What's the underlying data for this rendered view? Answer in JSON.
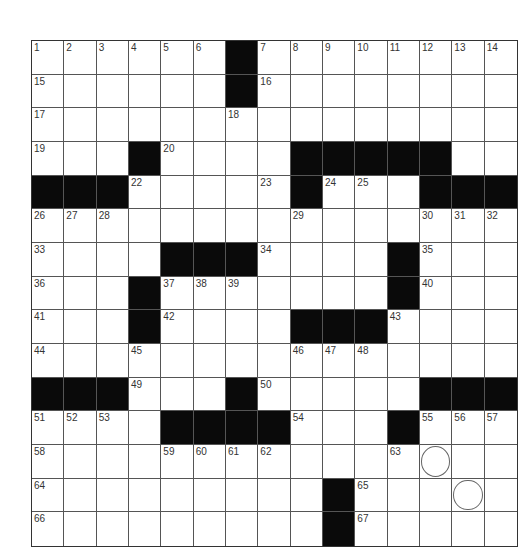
{
  "puzzle": {
    "rows": 15,
    "cols": 15,
    "layout": [
      "......#........",
      "......#........",
      "...............",
      "...#....#####..",
      "###.....#...###",
      "...............",
      "....###....#...",
      "...#.......#...",
      "...#....###....",
      "...............",
      "###...#.....###",
      "....####...#...",
      "...............",
      ".........#.....",
      ".........#....."
    ],
    "numbers": [
      {
        "r": 0,
        "c": 0,
        "n": "1"
      },
      {
        "r": 0,
        "c": 1,
        "n": "2"
      },
      {
        "r": 0,
        "c": 2,
        "n": "3"
      },
      {
        "r": 0,
        "c": 3,
        "n": "4"
      },
      {
        "r": 0,
        "c": 4,
        "n": "5"
      },
      {
        "r": 0,
        "c": 5,
        "n": "6"
      },
      {
        "r": 0,
        "c": 7,
        "n": "7"
      },
      {
        "r": 0,
        "c": 8,
        "n": "8"
      },
      {
        "r": 0,
        "c": 9,
        "n": "9"
      },
      {
        "r": 0,
        "c": 10,
        "n": "10"
      },
      {
        "r": 0,
        "c": 11,
        "n": "11"
      },
      {
        "r": 0,
        "c": 12,
        "n": "12"
      },
      {
        "r": 0,
        "c": 13,
        "n": "13"
      },
      {
        "r": 0,
        "c": 14,
        "n": "14"
      },
      {
        "r": 1,
        "c": 0,
        "n": "15"
      },
      {
        "r": 1,
        "c": 7,
        "n": "16"
      },
      {
        "r": 2,
        "c": 0,
        "n": "17"
      },
      {
        "r": 2,
        "c": 6,
        "n": "18"
      },
      {
        "r": 3,
        "c": 0,
        "n": "19"
      },
      {
        "r": 3,
        "c": 4,
        "n": "20"
      },
      {
        "r": 3,
        "c": 11,
        "n": "21"
      },
      {
        "r": 4,
        "c": 3,
        "n": "22"
      },
      {
        "r": 4,
        "c": 7,
        "n": "23"
      },
      {
        "r": 4,
        "c": 9,
        "n": "24"
      },
      {
        "r": 4,
        "c": 10,
        "n": "25"
      },
      {
        "r": 5,
        "c": 0,
        "n": "26"
      },
      {
        "r": 5,
        "c": 1,
        "n": "27"
      },
      {
        "r": 5,
        "c": 2,
        "n": "28"
      },
      {
        "r": 5,
        "c": 8,
        "n": "29"
      },
      {
        "r": 5,
        "c": 12,
        "n": "30"
      },
      {
        "r": 5,
        "c": 13,
        "n": "31"
      },
      {
        "r": 5,
        "c": 14,
        "n": "32"
      },
      {
        "r": 6,
        "c": 0,
        "n": "33"
      },
      {
        "r": 6,
        "c": 7,
        "n": "34"
      },
      {
        "r": 6,
        "c": 12,
        "n": "35"
      },
      {
        "r": 7,
        "c": 0,
        "n": "36"
      },
      {
        "r": 7,
        "c": 4,
        "n": "37"
      },
      {
        "r": 7,
        "c": 5,
        "n": "38"
      },
      {
        "r": 7,
        "c": 6,
        "n": "39"
      },
      {
        "r": 7,
        "c": 12,
        "n": "40"
      },
      {
        "r": 8,
        "c": 0,
        "n": "41"
      },
      {
        "r": 8,
        "c": 4,
        "n": "42"
      },
      {
        "r": 8,
        "c": 11,
        "n": "43"
      },
      {
        "r": 9,
        "c": 0,
        "n": "44"
      },
      {
        "r": 9,
        "c": 3,
        "n": "45"
      },
      {
        "r": 9,
        "c": 8,
        "n": "46"
      },
      {
        "r": 9,
        "c": 9,
        "n": "47"
      },
      {
        "r": 9,
        "c": 10,
        "n": "48"
      },
      {
        "r": 10,
        "c": 3,
        "n": "49"
      },
      {
        "r": 10,
        "c": 7,
        "n": "50"
      },
      {
        "r": 11,
        "c": 0,
        "n": "51"
      },
      {
        "r": 11,
        "c": 1,
        "n": "52"
      },
      {
        "r": 11,
        "c": 2,
        "n": "53"
      },
      {
        "r": 11,
        "c": 8,
        "n": "54"
      },
      {
        "r": 11,
        "c": 12,
        "n": "55"
      },
      {
        "r": 11,
        "c": 13,
        "n": "56"
      },
      {
        "r": 11,
        "c": 14,
        "n": "57"
      },
      {
        "r": 12,
        "c": 0,
        "n": "58"
      },
      {
        "r": 12,
        "c": 4,
        "n": "59"
      },
      {
        "r": 12,
        "c": 5,
        "n": "60"
      },
      {
        "r": 12,
        "c": 6,
        "n": "61"
      },
      {
        "r": 12,
        "c": 7,
        "n": "62"
      },
      {
        "r": 12,
        "c": 11,
        "n": "63"
      },
      {
        "r": 13,
        "c": 0,
        "n": "64"
      },
      {
        "r": 13,
        "c": 10,
        "n": "65"
      },
      {
        "r": 14,
        "c": 0,
        "n": "66"
      },
      {
        "r": 14,
        "c": 10,
        "n": "67"
      }
    ],
    "circles": [
      {
        "r": 12,
        "c": 12
      },
      {
        "r": 13,
        "c": 13
      }
    ],
    "colors": {
      "block": "#0a0a0a",
      "cell": "#ffffff",
      "line": "#555555"
    }
  }
}
